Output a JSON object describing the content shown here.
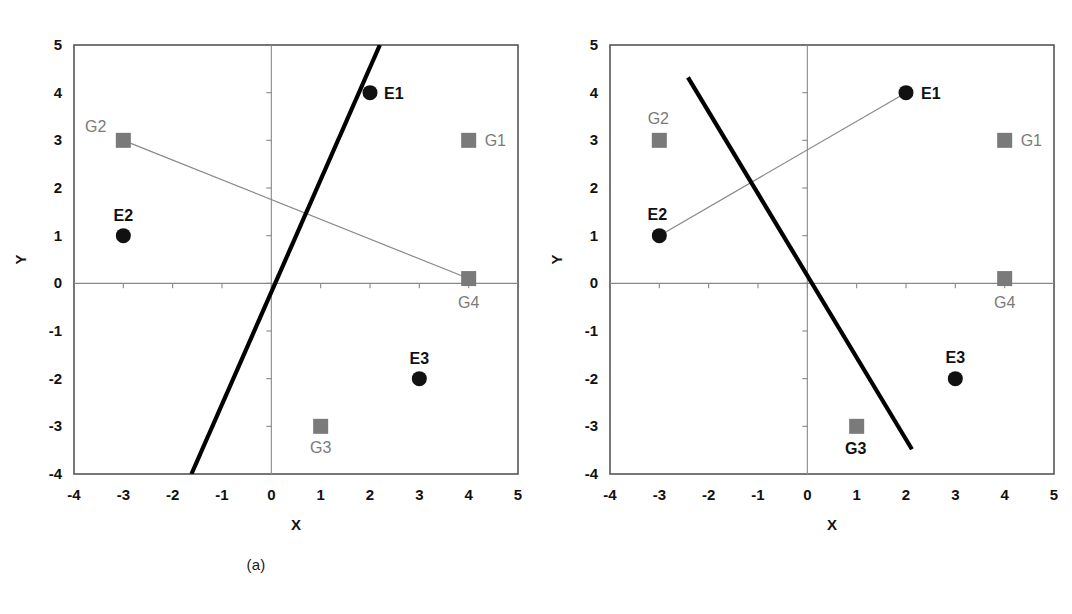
{
  "figure": {
    "width": 1072,
    "height": 614,
    "background": "#ffffff",
    "marker_colors": {
      "e_point": "#111111",
      "g_point": "#7a7a7a",
      "thick_line": "#000000",
      "thin_line": "#888888",
      "frame": "#555555",
      "axis": "#888888",
      "label_dark": "#111111",
      "label_gray": "#7a7a7a"
    }
  },
  "panels": [
    {
      "id": "a",
      "caption": "(a)",
      "axes": {
        "xlabel": "X",
        "ylabel": "Y",
        "xlim": [
          -4,
          5
        ],
        "ylim": [
          -4,
          5
        ],
        "xticks": [
          "-4",
          "-3",
          "-2",
          "-1",
          "0",
          "1",
          "2",
          "3",
          "4",
          "5"
        ],
        "yticks": [
          "5",
          "4",
          "3",
          "2",
          "1",
          "0",
          "-1",
          "-2",
          "-3",
          "-4"
        ],
        "xtick_values": [
          -4,
          -3,
          -2,
          -1,
          0,
          1,
          2,
          3,
          4,
          5
        ],
        "ytick_values": [
          5,
          4,
          3,
          2,
          1,
          0,
          -1,
          -2,
          -3,
          -4
        ],
        "grid": false
      },
      "points": [
        {
          "label": "E1",
          "x": 2,
          "y": 4,
          "marker": "circle",
          "color": "#111111",
          "label_color": "#111111",
          "label_bold": true,
          "label_dx": 14,
          "label_dy": 1
        },
        {
          "label": "E2",
          "x": -3,
          "y": 1,
          "marker": "circle",
          "color": "#111111",
          "label_color": "#111111",
          "label_bold": true,
          "label_dx": 0,
          "label_dy": -20
        },
        {
          "label": "E3",
          "x": 3,
          "y": -2,
          "marker": "circle",
          "color": "#111111",
          "label_color": "#111111",
          "label_bold": true,
          "label_dx": 0,
          "label_dy": -20
        },
        {
          "label": "G1",
          "x": 4,
          "y": 3,
          "marker": "square",
          "color": "#7a7a7a",
          "label_color": "#7a7a7a",
          "label_bold": false,
          "label_dx": 16,
          "label_dy": 1
        },
        {
          "label": "G2",
          "x": -3,
          "y": 3,
          "marker": "square",
          "color": "#7a7a7a",
          "label_color": "#7a7a7a",
          "label_bold": false,
          "label_dx": -17,
          "label_dy": -13
        },
        {
          "label": "G3",
          "x": 1,
          "y": -3,
          "marker": "square",
          "color": "#7a7a7a",
          "label_color": "#7a7a7a",
          "label_bold": false,
          "label_dx": 0,
          "label_dy": 22
        },
        {
          "label": "G4",
          "x": 4,
          "y": 0.1,
          "marker": "square",
          "color": "#7a7a7a",
          "label_color": "#7a7a7a",
          "label_bold": false,
          "label_dx": 0,
          "label_dy": 24
        }
      ],
      "thick_line": {
        "x1": 2.2,
        "y1": 5,
        "x2": -1.62,
        "y2": -4
      },
      "thin_line": {
        "x1": -3,
        "y1": 3,
        "x2": 4,
        "y2": 0.1
      }
    },
    {
      "id": "b",
      "caption": "(b)",
      "axes": {
        "xlabel": "X",
        "ylabel": "Y",
        "xlim": [
          -4,
          5
        ],
        "ylim": [
          -4,
          5
        ],
        "xticks": [
          "-4",
          "-3",
          "-2",
          "-1",
          "0",
          "1",
          "2",
          "3",
          "4",
          "5"
        ],
        "yticks": [
          "5",
          "4",
          "3",
          "2",
          "1",
          "0",
          "-1",
          "-2",
          "-3",
          "-4"
        ],
        "xtick_values": [
          -4,
          -3,
          -2,
          -1,
          0,
          1,
          2,
          3,
          4,
          5
        ],
        "ytick_values": [
          5,
          4,
          3,
          2,
          1,
          0,
          -1,
          -2,
          -3,
          -4
        ],
        "grid": false
      },
      "points": [
        {
          "label": "E1",
          "x": 2,
          "y": 4,
          "marker": "circle",
          "color": "#111111",
          "label_color": "#111111",
          "label_bold": true,
          "label_dx": 15,
          "label_dy": 1
        },
        {
          "label": "E2",
          "x": -3,
          "y": 1,
          "marker": "circle",
          "color": "#111111",
          "label_color": "#111111",
          "label_bold": true,
          "label_dx": -2,
          "label_dy": -21
        },
        {
          "label": "E3",
          "x": 3,
          "y": -2,
          "marker": "circle",
          "color": "#111111",
          "label_color": "#111111",
          "label_bold": true,
          "label_dx": 0,
          "label_dy": -21
        },
        {
          "label": "G1",
          "x": 4,
          "y": 3,
          "marker": "square",
          "color": "#7a7a7a",
          "label_color": "#7a7a7a",
          "label_bold": false,
          "label_dx": 16,
          "label_dy": 1
        },
        {
          "label": "G2",
          "x": -3,
          "y": 3,
          "marker": "square",
          "color": "#7a7a7a",
          "label_color": "#7a7a7a",
          "label_bold": false,
          "label_dx": -1,
          "label_dy": -21
        },
        {
          "label": "G3",
          "x": 1,
          "y": -3,
          "marker": "square",
          "color": "#7a7a7a",
          "label_color": "#111111",
          "label_bold": true,
          "label_dx": -1,
          "label_dy": 23
        },
        {
          "label": "G4",
          "x": 4,
          "y": 0.1,
          "marker": "square",
          "color": "#7a7a7a",
          "label_color": "#7a7a7a",
          "label_bold": false,
          "label_dx": 0,
          "label_dy": 24
        }
      ],
      "thick_line": {
        "x1": -2.42,
        "y1": 4.32,
        "x2": 2.12,
        "y2": -3.48
      },
      "thin_line": {
        "x1": -3,
        "y1": 1,
        "x2": 2,
        "y2": 4
      }
    }
  ],
  "chart_data": {
    "type": "scatter",
    "title": "",
    "xlabel": "X",
    "ylabel": "Y",
    "xlim": [
      -4,
      5
    ],
    "ylim": [
      -4,
      5
    ],
    "grid": false,
    "legend": "none",
    "subplots": [
      {
        "panel": "a",
        "caption": "(a)",
        "series": [
          {
            "name": "E points",
            "marker": "filled-circle",
            "color": "#111111",
            "points": [
              {
                "label": "E1",
                "x": 2,
                "y": 4
              },
              {
                "label": "E2",
                "x": -3,
                "y": 1
              },
              {
                "label": "E3",
                "x": 3,
                "y": -2
              }
            ]
          },
          {
            "name": "G points",
            "marker": "filled-square",
            "color": "#7a7a7a",
            "points": [
              {
                "label": "G1",
                "x": 4,
                "y": 3
              },
              {
                "label": "G2",
                "x": -3,
                "y": 3
              },
              {
                "label": "G3",
                "x": 1,
                "y": -3
              },
              {
                "label": "G4",
                "x": 4,
                "y": 0.1
              }
            ]
          }
        ],
        "lines": [
          {
            "name": "thick separator line",
            "style": "thick-solid",
            "color": "#000000",
            "from": [
              2.2,
              5
            ],
            "to": [
              -1.62,
              -4
            ]
          },
          {
            "name": "G2-G4 connector",
            "style": "thin-solid",
            "color": "#888888",
            "from": [
              -3,
              3
            ],
            "to": [
              4,
              0.1
            ]
          }
        ]
      },
      {
        "panel": "b",
        "caption": "(b)",
        "series": [
          {
            "name": "E points",
            "marker": "filled-circle",
            "color": "#111111",
            "points": [
              {
                "label": "E1",
                "x": 2,
                "y": 4
              },
              {
                "label": "E2",
                "x": -3,
                "y": 1
              },
              {
                "label": "E3",
                "x": 3,
                "y": -2
              }
            ]
          },
          {
            "name": "G points",
            "marker": "filled-square",
            "color": "#7a7a7a",
            "points": [
              {
                "label": "G1",
                "x": 4,
                "y": 3
              },
              {
                "label": "G2",
                "x": -3,
                "y": 3
              },
              {
                "label": "G3",
                "x": 1,
                "y": -3
              },
              {
                "label": "G4",
                "x": 4,
                "y": 0.1
              }
            ]
          }
        ],
        "lines": [
          {
            "name": "thick separator line",
            "style": "thick-solid",
            "color": "#000000",
            "from": [
              -2.42,
              4.32
            ],
            "to": [
              2.12,
              -3.48
            ]
          },
          {
            "name": "E2-E1 connector",
            "style": "thin-solid",
            "color": "#888888",
            "from": [
              -3,
              1
            ],
            "to": [
              2,
              4
            ]
          }
        ]
      }
    ]
  }
}
